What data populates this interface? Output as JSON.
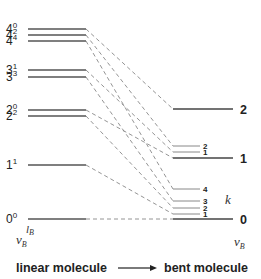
{
  "diagram": {
    "left_label": "linear molecule",
    "right_label": "bent molecule",
    "arrow": "→",
    "left_axis": {
      "v": "v",
      "v_sub": "B",
      "l": "l",
      "l_sub": "B"
    },
    "right_axis": {
      "v": "v",
      "v_sub": "B"
    },
    "k_label": "k",
    "left_levels": [
      {
        "id": "4_0",
        "v": "4",
        "l": "0",
        "y": 29
      },
      {
        "id": "4_2",
        "v": "4",
        "l": "2",
        "y": 35
      },
      {
        "id": "4_4",
        "v": "4",
        "l": "4",
        "y": 41
      },
      {
        "id": "3_1",
        "v": "3",
        "l": "1",
        "y": 70
      },
      {
        "id": "3_3",
        "v": "3",
        "l": "3",
        "y": 77
      },
      {
        "id": "2_0",
        "v": "2",
        "l": "0",
        "y": 110
      },
      {
        "id": "2_2",
        "v": "2",
        "l": "2",
        "y": 116
      },
      {
        "id": "1_1",
        "v": "1",
        "l": "1",
        "y": 165
      },
      {
        "id": "0_0",
        "v": "0",
        "l": "0",
        "y": 219
      }
    ],
    "right_main_levels": [
      {
        "id": "v2",
        "label": "2",
        "y": 109
      },
      {
        "id": "v1",
        "label": "1",
        "y": 158
      },
      {
        "id": "v0",
        "label": "0",
        "y": 219
      }
    ],
    "right_k_levels": [
      {
        "id": "v1k2",
        "label": "2",
        "y": 146
      },
      {
        "id": "v1k1",
        "label": "1",
        "y": 152
      },
      {
        "id": "v0k4",
        "label": "4",
        "y": 189
      },
      {
        "id": "v0k3",
        "label": "3",
        "y": 201
      },
      {
        "id": "v0k2",
        "label": "2",
        "y": 208
      },
      {
        "id": "v0k1",
        "label": "1",
        "y": 214
      }
    ],
    "connections": [
      {
        "from": "4_0",
        "to": "v2"
      },
      {
        "from": "4_2",
        "to": "v1k2"
      },
      {
        "from": "4_4",
        "to": "v0k4"
      },
      {
        "from": "3_1",
        "to": "v1k1"
      },
      {
        "from": "3_3",
        "to": "v0k3"
      },
      {
        "from": "2_0",
        "to": "v1"
      },
      {
        "from": "2_2",
        "to": "v0k2"
      },
      {
        "from": "1_1",
        "to": "v0k1"
      },
      {
        "from": "0_0",
        "to": "v0"
      }
    ]
  }
}
